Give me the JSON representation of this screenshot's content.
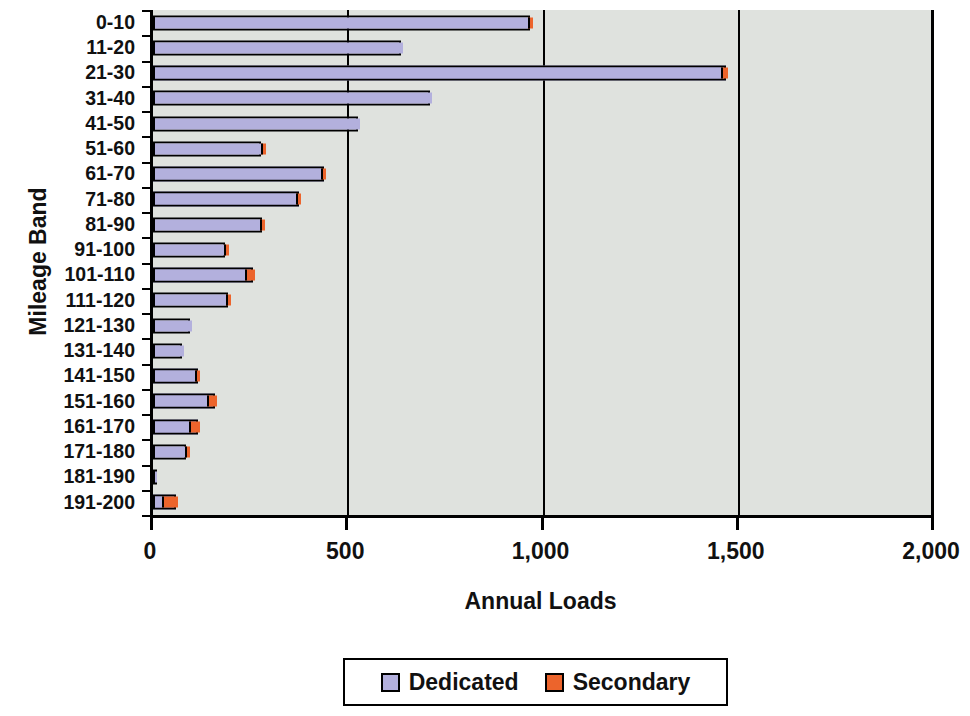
{
  "chart_data": {
    "type": "bar",
    "orientation": "horizontal",
    "stacked": true,
    "title": "",
    "xlabel": "Annual Loads",
    "ylabel": "Mileage Band",
    "xlim": [
      0,
      2000
    ],
    "xticks": [
      0,
      500,
      1000,
      1500,
      2000
    ],
    "xtick_labels": [
      "0",
      "500",
      "1,000",
      "1,500",
      "2,000"
    ],
    "grid": true,
    "legend_position": "bottom",
    "categories": [
      "0-10",
      "11-20",
      "21-30",
      "31-40",
      "41-50",
      "51-60",
      "61-70",
      "71-80",
      "81-90",
      "91-100",
      "101-110",
      "111-120",
      "121-130",
      "131-140",
      "141-150",
      "151-160",
      "161-170",
      "171-180",
      "181-190",
      "191-200"
    ],
    "series": [
      {
        "name": "Dedicated",
        "color": "#b3b0dd",
        "values": [
          955,
          635,
          1450,
          710,
          525,
          272,
          425,
          362,
          270,
          176,
          230,
          183,
          95,
          74,
          103,
          132,
          88,
          76,
          5,
          18
        ]
      },
      {
        "name": "Secondary",
        "color": "#ec642c",
        "values": [
          10,
          0,
          18,
          0,
          0,
          4,
          14,
          11,
          9,
          9,
          26,
          10,
          0,
          0,
          11,
          28,
          26,
          9,
          0,
          42
        ]
      }
    ],
    "totals": [
      965,
      635,
      1468,
      710,
      525,
      276,
      439,
      373,
      279,
      185,
      256,
      193,
      95,
      74,
      114,
      160,
      114,
      85,
      5,
      60
    ]
  },
  "legend": {
    "items": [
      {
        "label": "Dedicated",
        "color": "#b3b0dd"
      },
      {
        "label": "Secondary",
        "color": "#ec642c"
      }
    ]
  },
  "axes": {
    "x_title": "Annual Loads",
    "y_title": "Mileage Band"
  },
  "colors": {
    "plot_background": "#dfe2de",
    "axis": "#000000",
    "dedicated": "#b3b0dd",
    "secondary": "#ec642c"
  }
}
